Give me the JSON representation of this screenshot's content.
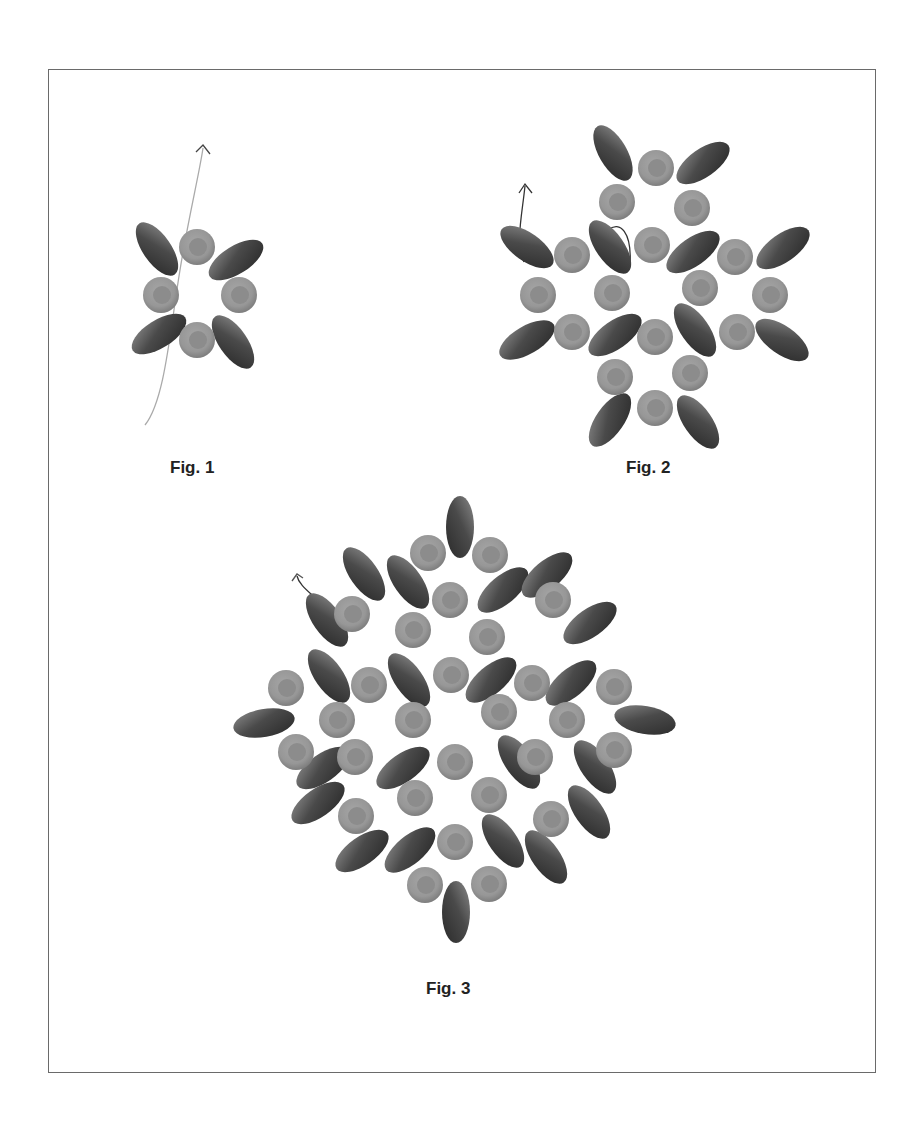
{
  "colors": {
    "border": "#6a6a6a",
    "round_outer": "#9a9a9a",
    "round_inner": "#8a8a8a",
    "oval_dark": "#2e2e2e",
    "oval_light": "#8a8a8a",
    "thread": "#555555",
    "thread_light": "#aaaaaa"
  },
  "figures": [
    {
      "label": "Fig. 1",
      "label_pos": [
        170,
        458
      ],
      "rounds": [
        [
          197,
          247
        ],
        [
          161,
          295
        ],
        [
          239,
          295
        ],
        [
          197,
          340
        ]
      ],
      "ovals": [
        [
          157,
          249,
          55
        ],
        [
          236,
          260,
          -32
        ],
        [
          159,
          334,
          -32
        ],
        [
          233,
          342,
          55
        ]
      ],
      "threads": [
        {
          "d": "M145,425 C165,400 170,330 180,270 C188,220 200,170 203,148",
          "color": "#aaaaaa"
        },
        {
          "d": "M196,152 L203,145 L210,154",
          "color": "#444444"
        }
      ]
    },
    {
      "label": "Fig. 2",
      "label_pos": [
        626,
        458
      ],
      "rounds": [
        [
          656,
          168
        ],
        [
          617,
          202
        ],
        [
          692,
          208
        ],
        [
          572,
          255
        ],
        [
          652,
          245
        ],
        [
          735,
          257
        ],
        [
          538,
          295
        ],
        [
          612,
          293
        ],
        [
          700,
          288
        ],
        [
          770,
          295
        ],
        [
          572,
          332
        ],
        [
          655,
          337
        ],
        [
          737,
          332
        ],
        [
          615,
          377
        ],
        [
          690,
          373
        ],
        [
          655,
          408
        ]
      ],
      "ovals": [
        [
          613,
          153,
          60
        ],
        [
          703,
          163,
          -35
        ],
        [
          527,
          247,
          35
        ],
        [
          610,
          247,
          55
        ],
        [
          693,
          252,
          -35
        ],
        [
          783,
          248,
          -35
        ],
        [
          527,
          340,
          -30
        ],
        [
          615,
          335,
          -35
        ],
        [
          695,
          330,
          55
        ],
        [
          782,
          340,
          35
        ],
        [
          610,
          420,
          -55
        ],
        [
          698,
          422,
          55
        ]
      ],
      "threads": [
        {
          "d": "M524,262 C515,245 522,215 525,186",
          "color": "#333333"
        },
        {
          "d": "M519,193 L525,184 L532,193",
          "color": "#333333"
        },
        {
          "d": "M608,230 C620,220 632,232 630,265",
          "color": "#333333"
        }
      ]
    },
    {
      "label": "Fig. 3",
      "label_pos": [
        426,
        979
      ],
      "rounds": [
        [
          428,
          553
        ],
        [
          490,
          555
        ],
        [
          352,
          614
        ],
        [
          450,
          600
        ],
        [
          553,
          600
        ],
        [
          413,
          630
        ],
        [
          487,
          637
        ],
        [
          286,
          688
        ],
        [
          369,
          685
        ],
        [
          451,
          675
        ],
        [
          532,
          683
        ],
        [
          614,
          687
        ],
        [
          337,
          720
        ],
        [
          413,
          720
        ],
        [
          499,
          712
        ],
        [
          567,
          720
        ],
        [
          296,
          752
        ],
        [
          355,
          757
        ],
        [
          455,
          762
        ],
        [
          535,
          757
        ],
        [
          614,
          750
        ],
        [
          415,
          798
        ],
        [
          489,
          795
        ],
        [
          356,
          816
        ],
        [
          551,
          819
        ],
        [
          455,
          842
        ],
        [
          425,
          885
        ],
        [
          489,
          884
        ]
      ],
      "ovals": [
        [
          460,
          527,
          90
        ],
        [
          364,
          574,
          55
        ],
        [
          408,
          582,
          55
        ],
        [
          503,
          590,
          -40
        ],
        [
          547,
          575,
          -40
        ],
        [
          327,
          620,
          55
        ],
        [
          590,
          623,
          -35
        ],
        [
          329,
          676,
          55
        ],
        [
          409,
          680,
          55
        ],
        [
          491,
          680,
          -40
        ],
        [
          571,
          683,
          -40
        ],
        [
          264,
          723,
          -10
        ],
        [
          645,
          720,
          10
        ],
        [
          323,
          768,
          -35
        ],
        [
          403,
          768,
          -35
        ],
        [
          519,
          762,
          55
        ],
        [
          595,
          767,
          55
        ],
        [
          318,
          803,
          -35
        ],
        [
          589,
          812,
          55
        ],
        [
          362,
          851,
          -35
        ],
        [
          410,
          850,
          -40
        ],
        [
          503,
          841,
          55
        ],
        [
          546,
          857,
          55
        ],
        [
          456,
          912,
          90
        ]
      ],
      "threads": [
        {
          "d": "M328,617 C325,600 300,590 297,576",
          "color": "#333333"
        },
        {
          "d": "M292,581 L297,574 L303,578",
          "color": "#555555"
        }
      ]
    }
  ]
}
